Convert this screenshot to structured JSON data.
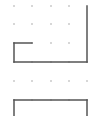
{
  "board": {
    "background": "#ffffff",
    "dot_color": "#b8b8b8",
    "line_color": "#555555",
    "columns_x": [
      14,
      32,
      51,
      69,
      87
    ],
    "rows_y": [
      6,
      24,
      43,
      62,
      81,
      100
    ],
    "dots": [
      [
        14,
        6
      ],
      [
        32,
        6
      ],
      [
        51,
        6
      ],
      [
        69,
        6
      ],
      [
        14,
        24
      ],
      [
        32,
        24
      ],
      [
        51,
        24
      ],
      [
        69,
        24
      ],
      [
        32,
        43
      ],
      [
        51,
        43
      ],
      [
        69,
        43
      ],
      [
        32,
        62
      ],
      [
        51,
        62
      ],
      [
        69,
        62
      ],
      [
        14,
        81
      ],
      [
        32,
        81
      ],
      [
        51,
        81
      ],
      [
        69,
        81
      ],
      [
        87,
        81
      ],
      [
        32,
        100
      ],
      [
        51,
        100
      ],
      [
        69,
        100
      ]
    ],
    "lines": [
      {
        "name": "right-edge-top",
        "x1": 87,
        "y1": 6,
        "x2": 87,
        "y2": 62
      },
      {
        "name": "inner-top",
        "x1": 14,
        "y1": 43,
        "x2": 32,
        "y2": 43
      },
      {
        "name": "left-inner",
        "x1": 14,
        "y1": 43,
        "x2": 14,
        "y2": 62
      },
      {
        "name": "middle-bottom",
        "x1": 14,
        "y1": 62,
        "x2": 87,
        "y2": 62
      },
      {
        "name": "lower-top",
        "x1": 14,
        "y1": 100,
        "x2": 87,
        "y2": 100
      },
      {
        "name": "lower-left",
        "x1": 14,
        "y1": 100,
        "x2": 14,
        "y2": 116
      },
      {
        "name": "lower-right",
        "x1": 87,
        "y1": 100,
        "x2": 87,
        "y2": 116
      }
    ]
  }
}
